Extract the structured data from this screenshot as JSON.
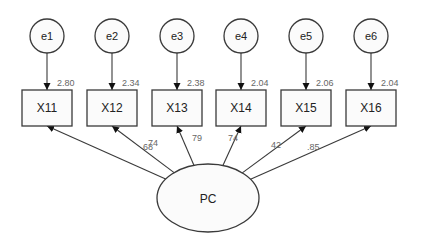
{
  "diagram": {
    "type": "structural-equation-model",
    "latent": {
      "id": "PC",
      "label": "PC",
      "cx": 208,
      "cy": 198,
      "rx": 51,
      "ry": 34
    },
    "errors": [
      {
        "id": "e1",
        "label": "e1",
        "cx": 47,
        "cy": 36
      },
      {
        "id": "e2",
        "label": "e2",
        "cx": 112,
        "cy": 36
      },
      {
        "id": "e3",
        "label": "e3",
        "cx": 177,
        "cy": 36
      },
      {
        "id": "e4",
        "label": "e4",
        "cx": 241,
        "cy": 36
      },
      {
        "id": "e5",
        "label": "e5",
        "cx": 306,
        "cy": 36
      },
      {
        "id": "e6",
        "label": "e6",
        "cx": 371,
        "cy": 36
      }
    ],
    "observed": [
      {
        "id": "X11",
        "label": "X11",
        "cx": 47,
        "variance": "2.80",
        "loading": "68",
        "loading_pos": [
          143,
          150
        ]
      },
      {
        "id": "X12",
        "label": "X12",
        "cx": 112,
        "variance": "2.34",
        "loading": "74",
        "loading_pos": [
          148,
          146
        ]
      },
      {
        "id": "X13",
        "label": "X13",
        "cx": 177,
        "variance": "2.38",
        "loading": "79",
        "loading_pos": [
          192,
          141
        ]
      },
      {
        "id": "X14",
        "label": "X14",
        "cx": 241,
        "variance": "2.04",
        "loading": "74",
        "loading_pos": [
          228,
          141
        ]
      },
      {
        "id": "X15",
        "label": "X15",
        "cx": 306,
        "variance": "2.06",
        "loading": "42",
        "loading_pos": [
          271,
          148
        ]
      },
      {
        "id": "X16",
        "label": "X16",
        "cx": 371,
        "variance": "2.04",
        "loading": ".85",
        "loading_pos": [
          307,
          150
        ]
      }
    ],
    "box": {
      "width": 50,
      "height": 36,
      "top": 90
    },
    "error_radius": 17
  }
}
